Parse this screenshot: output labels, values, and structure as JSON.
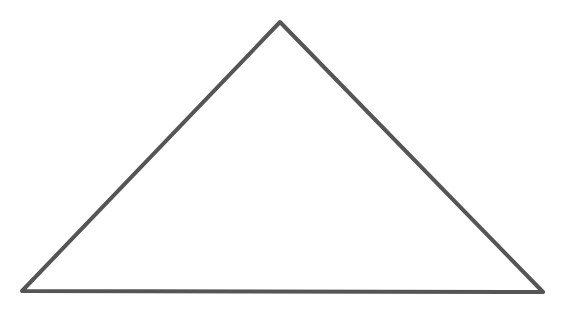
{
  "diagram": {
    "shape": "triangle",
    "stroke_color": "#555555",
    "fill_color": "#ffffff",
    "stroke_width": 4,
    "vertices": [
      {
        "name": "apex",
        "x": 280,
        "y": 22
      },
      {
        "name": "bottom-right",
        "x": 543,
        "y": 292
      },
      {
        "name": "bottom-left",
        "x": 22,
        "y": 291
      }
    ]
  }
}
